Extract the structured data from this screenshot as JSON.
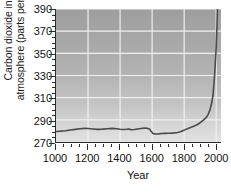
{
  "chart_data": {
    "type": "line",
    "title": "",
    "subtitle": "",
    "xlabel": "Year",
    "ylabel": "Carbon dioxide in the atmosphere (parts per million)",
    "ylabel_lines": [
      "Carbon dioxide in the",
      "atmosphere (parts per million)"
    ],
    "xlim": [
      1000,
      2030
    ],
    "ylim": [
      270,
      390
    ],
    "xticks": [
      1000,
      1200,
      1400,
      1600,
      1800,
      2000
    ],
    "xtick_labels": [
      "1000",
      "1200",
      "1400",
      "1600",
      "1800",
      "2000"
    ],
    "xminor_step": 50,
    "yticks": [
      270,
      290,
      310,
      330,
      350,
      370,
      390
    ],
    "ytick_labels": [
      "270",
      "290",
      "310",
      "330",
      "350",
      "370",
      "390"
    ],
    "yminor_step": 5,
    "grid": true,
    "grid_color": "#f0f0f0",
    "legend": "none",
    "plot_bg_top_color": "#9e9e9e",
    "plot_bg_bottom_color": "#e2e2e2",
    "line_color": "#4a4a4a",
    "line_width": 1.6,
    "axis_color": "#2b2b2b",
    "series": [
      {
        "name": "Atmospheric CO2",
        "x": [
          1000,
          1030,
          1060,
          1090,
          1120,
          1150,
          1180,
          1200,
          1230,
          1260,
          1290,
          1320,
          1350,
          1380,
          1400,
          1420,
          1440,
          1455,
          1470,
          1490,
          1510,
          1530,
          1550,
          1570,
          1585,
          1595,
          1605,
          1620,
          1640,
          1660,
          1680,
          1700,
          1720,
          1740,
          1760,
          1780,
          1795,
          1810,
          1820,
          1840,
          1860,
          1880,
          1900,
          1920,
          1940,
          1950,
          1960,
          1970,
          1980,
          1990,
          2000,
          2005,
          2008
        ],
        "y": [
          279.5,
          279.8,
          280.2,
          280.8,
          281.4,
          282.0,
          282.3,
          282.2,
          281.8,
          281.4,
          281.6,
          282.0,
          282.3,
          282.0,
          281.5,
          281.2,
          281.5,
          281.8,
          281.0,
          281.3,
          281.8,
          282.2,
          282.6,
          282.4,
          281.5,
          279.4,
          277.6,
          277.2,
          277.3,
          277.6,
          277.8,
          277.9,
          278.0,
          278.2,
          278.6,
          279.4,
          280.4,
          281.4,
          282.0,
          283.0,
          284.2,
          285.6,
          287.4,
          289.8,
          292.5,
          295.0,
          298.5,
          304.0,
          312.0,
          330.0,
          355.0,
          375.0,
          392.0
        ]
      }
    ],
    "annotations": []
  }
}
